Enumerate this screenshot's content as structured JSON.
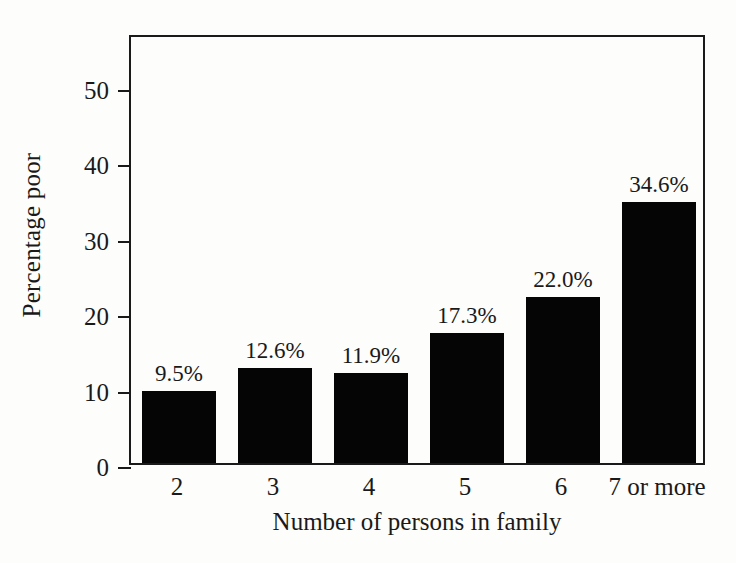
{
  "chart_data": {
    "type": "bar",
    "title": "",
    "subtitle": "",
    "xlabel": "Number of persons in family",
    "ylabel": "Percentage poor",
    "categories": [
      "2",
      "3",
      "4",
      "5",
      "6",
      "7 or more"
    ],
    "values": [
      9.5,
      12.6,
      11.9,
      17.3,
      22.0,
      34.6
    ],
    "data_labels": [
      "9.5%",
      "12.6%",
      "11.9%",
      "17.3%",
      "22.0%",
      "34.6%"
    ],
    "ylim": [
      0,
      57
    ],
    "yticks": [
      0,
      10,
      20,
      30,
      40,
      50
    ],
    "ytick_labels": [
      "0",
      "10",
      "20",
      "30",
      "40",
      "50"
    ],
    "grid": false,
    "legend": null,
    "legend_position": "none",
    "series": [
      {
        "name": "Percentage poor",
        "values": [
          9.5,
          12.6,
          11.9,
          17.3,
          22.0,
          34.6
        ]
      }
    ],
    "colors": {
      "bar_fill": "#050505",
      "axis": "#1a1a1a",
      "background": "#fdfdfc",
      "text": "#1a1a1a"
    }
  }
}
